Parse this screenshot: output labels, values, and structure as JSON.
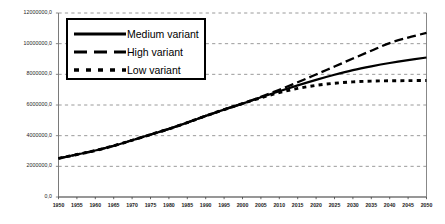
{
  "chart_data": {
    "type": "line",
    "title": "",
    "subtitle": "",
    "xlabel": "",
    "ylabel": "",
    "xlim": [
      1950,
      2050
    ],
    "ylim": [
      0,
      12000000
    ],
    "grid": true,
    "grid_axis": "y",
    "legend_position": "upper-left-inside",
    "x": [
      1950,
      1955,
      1960,
      1965,
      1970,
      1975,
      1980,
      1985,
      1990,
      1995,
      2000,
      2005,
      2010,
      2015,
      2020,
      2025,
      2030,
      2035,
      2040,
      2045,
      2050
    ],
    "xtick_labels": [
      "1950",
      "1955",
      "1960",
      "1965",
      "1970",
      "1975",
      "1980",
      "1985",
      "1990",
      "1995",
      "2000",
      "2005",
      "2010",
      "2015",
      "2020",
      "2025",
      "2030",
      "2035",
      "2040",
      "2045",
      "2050"
    ],
    "ytick_labels": [
      "0,0",
      "2000000,0",
      "4000000,0",
      "6000000,0",
      "8000000,0",
      "10000000,0",
      "12000000,0"
    ],
    "ytick_values": [
      0,
      2000000,
      4000000,
      6000000,
      8000000,
      10000000,
      12000000
    ],
    "series": [
      {
        "name": "Medium variant",
        "style": "solid",
        "values": [
          2520000,
          2770000,
          3030000,
          3340000,
          3700000,
          4070000,
          4440000,
          4850000,
          5290000,
          5700000,
          6090000,
          6500000,
          6900000,
          7280000,
          7640000,
          7970000,
          8270000,
          8520000,
          8740000,
          8930000,
          9100000
        ]
      },
      {
        "name": "High variant",
        "style": "dashed-long",
        "values": [
          2520000,
          2770000,
          3030000,
          3340000,
          3700000,
          4070000,
          4440000,
          4850000,
          5290000,
          5700000,
          6090000,
          6530000,
          6990000,
          7480000,
          7990000,
          8510000,
          9030000,
          9540000,
          10040000,
          10400000,
          10700000
        ]
      },
      {
        "name": "Low variant",
        "style": "dashed-short",
        "values": [
          2520000,
          2770000,
          3030000,
          3340000,
          3700000,
          4070000,
          4440000,
          4850000,
          5290000,
          5700000,
          6090000,
          6470000,
          6810000,
          7080000,
          7280000,
          7420000,
          7510000,
          7560000,
          7580000,
          7590000,
          7600000
        ]
      }
    ]
  },
  "legend": {
    "items": [
      {
        "label": "Medium variant",
        "style": "solid"
      },
      {
        "label": "High variant",
        "style": "dashed-long"
      },
      {
        "label": "Low variant",
        "style": "dashed-short"
      }
    ]
  },
  "colors": {
    "line": "#000000",
    "grid": "#808080",
    "axis": "#7a7a7a",
    "text": "#1a1a1a",
    "background": "#ffffff"
  }
}
